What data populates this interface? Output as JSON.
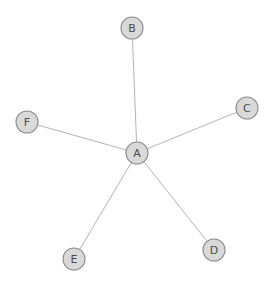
{
  "diagram": {
    "type": "node-link-graph",
    "background_color": "#ffffff",
    "canvas": {
      "width": 276,
      "height": 283
    },
    "style": {
      "node_fill": "#d9d9d9",
      "node_stroke": "#8d8d8d",
      "node_radius": 11,
      "edge_color": "#b4b4b4",
      "edge_width": 1,
      "label_color": "#4a4a4a",
      "label_size": 11
    },
    "nodes": [
      {
        "id": "A",
        "label": "A",
        "x": 137,
        "y": 153,
        "role": "hub"
      },
      {
        "id": "B",
        "label": "B",
        "x": 132,
        "y": 28,
        "role": "leaf"
      },
      {
        "id": "C",
        "label": "C",
        "x": 247,
        "y": 108,
        "role": "leaf"
      },
      {
        "id": "D",
        "label": "D",
        "x": 214,
        "y": 250,
        "role": "leaf"
      },
      {
        "id": "E",
        "label": "E",
        "x": 74,
        "y": 259,
        "role": "leaf"
      },
      {
        "id": "F",
        "label": "F",
        "x": 27,
        "y": 122,
        "role": "leaf"
      }
    ],
    "edges": [
      {
        "from": "A",
        "to": "B"
      },
      {
        "from": "A",
        "to": "C"
      },
      {
        "from": "A",
        "to": "D"
      },
      {
        "from": "A",
        "to": "E"
      },
      {
        "from": "A",
        "to": "F"
      }
    ]
  }
}
